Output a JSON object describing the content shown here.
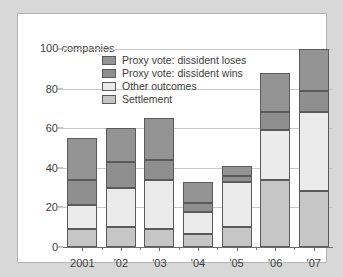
{
  "chart_data": {
    "type": "bar",
    "subtype": "stacked-bar",
    "title": "",
    "xlabel": "",
    "ylabel": "100 companies",
    "axis_unit_label": "100 companies",
    "categories": [
      "2001",
      "'02",
      "'03",
      "'04",
      "'05",
      "'06",
      "'07"
    ],
    "ylim": [
      0,
      100
    ],
    "yticks": [
      0,
      20,
      40,
      60,
      80,
      100
    ],
    "ytick_labels": [
      "0",
      "20",
      "40",
      "60",
      "80",
      "100"
    ],
    "grid": true,
    "legend_position": "top-center-inside",
    "stack_order_bottom_to_top": [
      "Settlement",
      "Other outcomes",
      "Proxy vote: dissident wins",
      "Proxy vote: dissident loses"
    ],
    "series": [
      {
        "name": "Settlement",
        "color": "#c6c6c6",
        "values": [
          9,
          10,
          9,
          6.5,
          10,
          34,
          28.5
        ]
      },
      {
        "name": "Other outcomes",
        "color": "#ebebeb",
        "values": [
          12,
          20,
          25,
          11,
          23,
          25,
          39.5
        ]
      },
      {
        "name": "Proxy vote: dissident wins",
        "color": "#8f8f8f",
        "values": [
          13,
          13,
          10,
          4.5,
          3,
          9,
          11
        ]
      },
      {
        "name": "Proxy vote: dissident loses",
        "color": "#949494",
        "values": [
          21,
          17,
          21,
          11,
          5,
          20,
          21
        ]
      }
    ],
    "totals": [
      55,
      60,
      65,
      33,
      41,
      88,
      100
    ],
    "cumulative_boundaries": {
      "2001": [
        9,
        21,
        34,
        55
      ],
      "'02": [
        10,
        30,
        43,
        60
      ],
      "'03": [
        9,
        34,
        44,
        65
      ],
      "'04": [
        6.5,
        17.5,
        22,
        33
      ],
      "'05": [
        10,
        33,
        36,
        41
      ],
      "'06": [
        34,
        59,
        68,
        88
      ],
      "'07": [
        28.5,
        68,
        79,
        100
      ]
    }
  },
  "legend": {
    "items": [
      {
        "label": "Proxy vote: dissident loses",
        "color": "#949494"
      },
      {
        "label": "Proxy vote: dissident wins",
        "color": "#8f8f8f"
      },
      {
        "label": "Other outcomes",
        "color": "#ebebeb"
      },
      {
        "label": "Settlement",
        "color": "#c6c6c6"
      }
    ]
  },
  "colors": {
    "page_background": "#d8d8d8",
    "card_background": "#ffffff",
    "card_border": "#b4b4b4",
    "gridline": "#c8c8c8",
    "axis": "#6e6e6e",
    "text": "#3c3c3c",
    "bar_outline": "#5a5a5a"
  }
}
